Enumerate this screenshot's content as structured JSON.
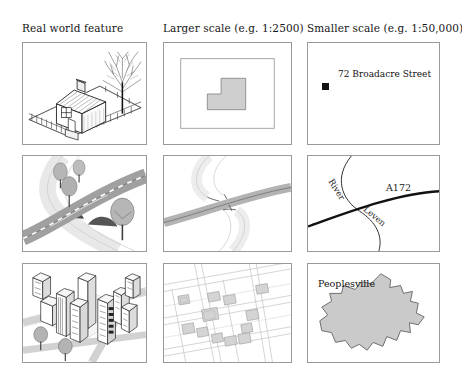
{
  "figure": {
    "columns": [
      {
        "id": "real-world",
        "label": "Real world feature"
      },
      {
        "id": "larger-scale",
        "label": "Larger scale (e.g. 1:2500)"
      },
      {
        "id": "smaller-scale",
        "label": "Smaller scale (e.g. 1:50,000)"
      }
    ],
    "rows": [
      {
        "id": "house",
        "theme": "single building"
      },
      {
        "id": "river-road",
        "theme": "river crossed by road"
      },
      {
        "id": "town",
        "theme": "urban settlement"
      }
    ]
  },
  "panels": {
    "house_real": {
      "name": "house-illustration",
      "description": "pictorial drawing of a detached house with chimney, fence and bare tree"
    },
    "house_large": {
      "name": "building-footprint",
      "description": "L-shaped building footprint inside plot boundary"
    },
    "house_small": {
      "name": "address-point",
      "address_label": "72 Broadacre Street",
      "symbol": "filled-square"
    },
    "river_real": {
      "name": "road-bridge-illustration",
      "description": "road with dashed centre line crossing river on arched bridge with trees"
    },
    "river_large": {
      "name": "road-river-bands",
      "description": "road band crossing river band at a bridge"
    },
    "river_small": {
      "name": "road-river-lines",
      "river_label_part1": "River",
      "river_label_part2": "Leven",
      "road_label": "A172"
    },
    "town_real": {
      "name": "city-illustration",
      "description": "oblique view of tower blocks, streets and trees"
    },
    "town_large": {
      "name": "street-block-plan",
      "description": "street network with individual building blocks"
    },
    "town_small": {
      "name": "settlement-polygon",
      "town_label": "Peoplesville"
    }
  },
  "colors": {
    "panel_border": "#9a9a9a",
    "ink": "#1a1a1a",
    "fill_grey": "#cfcfcf",
    "fill_light": "#e4e4e4",
    "road_grey": "#a8a8a8",
    "water_light": "#ededed",
    "background": "#ffffff"
  }
}
